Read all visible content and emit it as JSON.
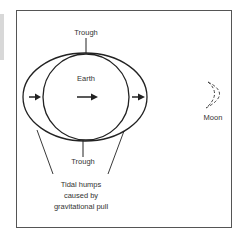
{
  "diagram": {
    "labels": {
      "trough_top": "Trough",
      "earth": "Earth",
      "trough_bottom": "Trough",
      "moon": "Moon",
      "humps_line1": "Tidal humps",
      "humps_line2": "caused by",
      "humps_line3": "gravitational pull"
    },
    "colors": {
      "stroke": "#222222",
      "text": "#333333",
      "frame": "#555555"
    }
  }
}
